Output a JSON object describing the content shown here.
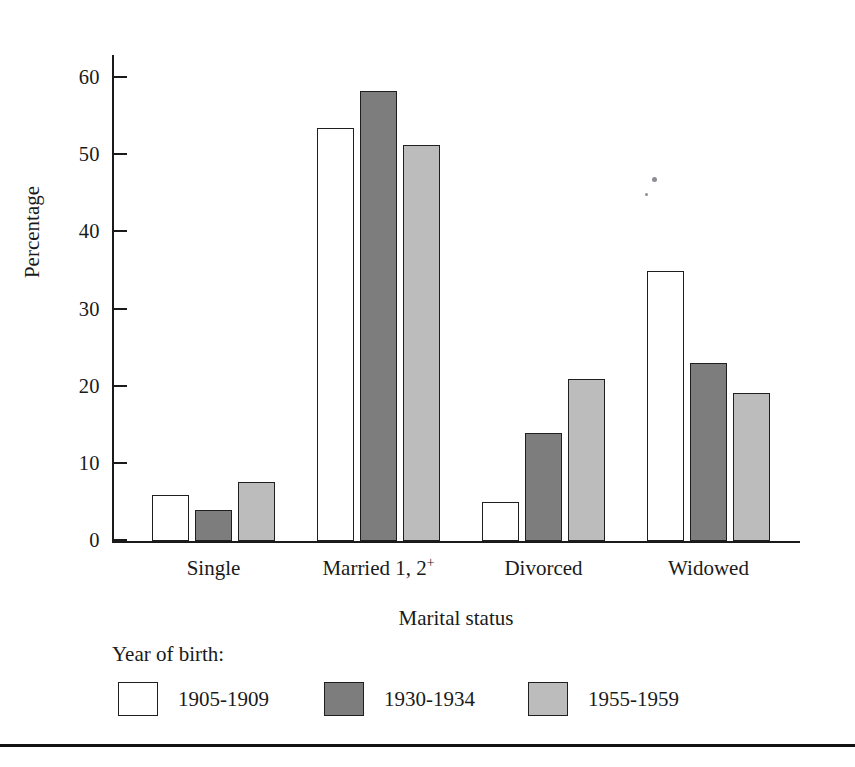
{
  "chart_data": {
    "type": "bar",
    "title": "",
    "xlabel": "Marital status",
    "ylabel": "Percentage",
    "ylim": [
      0,
      63
    ],
    "yticks": [
      0,
      10,
      20,
      30,
      40,
      50,
      60
    ],
    "ytick_labels": [
      "0",
      "10",
      "20",
      "30",
      "40",
      "50",
      "60"
    ],
    "grid": false,
    "legend_position": "below-plot",
    "legend_title": "Year of birth:",
    "categories": [
      "Single",
      "Married 1, 2+",
      "Divorced",
      "Widowed"
    ],
    "category_labels_html": [
      "Single",
      "Married 1, 2<sup>+</sup>",
      "Divorced",
      "Widowed"
    ],
    "series": [
      {
        "name": "1905-1909",
        "color": "#ffffff",
        "values": [
          6.0,
          53.5,
          5.0,
          35.0
        ]
      },
      {
        "name": "1930-1934",
        "color": "#7d7d7d",
        "values": [
          4.0,
          58.3,
          14.0,
          23.1
        ]
      },
      {
        "name": "1955-1959",
        "color": "#bcbcbc",
        "values": [
          7.6,
          51.4,
          21.0,
          19.2
        ]
      }
    ]
  },
  "axis": {
    "y_title": "Percentage",
    "x_title": "Marital status"
  },
  "legend": {
    "title": "Year of birth:",
    "entries": [
      {
        "label": "1905-1909",
        "swatch": "white-swatch"
      },
      {
        "label": "1930-1934",
        "swatch": "dark-gray-swatch"
      },
      {
        "label": "1955-1959",
        "swatch": "light-gray-swatch"
      }
    ]
  },
  "colors": {
    "series_1": "#ffffff",
    "series_2": "#7d7d7d",
    "series_3": "#bcbcbc",
    "ink": "#1a1a1a",
    "page": "#ffffff"
  }
}
